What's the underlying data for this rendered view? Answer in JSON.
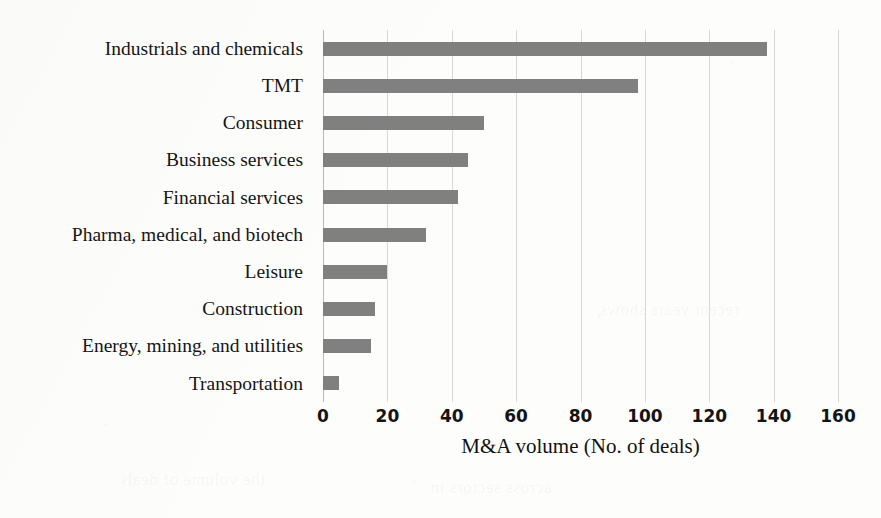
{
  "chart_data": {
    "type": "bar",
    "orientation": "horizontal",
    "title": "",
    "subtitle": "",
    "xlabel": "M&A volume (No. of deals)",
    "ylabel": "",
    "xlim": [
      0,
      160
    ],
    "xticks": [
      "0",
      "20",
      "40",
      "60",
      "80",
      "100",
      "120",
      "140",
      "160"
    ],
    "xtick_values": [
      0,
      20,
      40,
      60,
      80,
      100,
      120,
      140,
      160
    ],
    "grid": "vertical",
    "legend": "none",
    "bar_color": "#808080",
    "gridline_color": "#d8d8d6",
    "background_color": "#fdfdfc",
    "categories": [
      "Industrials and chemicals",
      "TMT",
      "Consumer",
      "Business services",
      "Financial services",
      "Pharma, medical, and biotech",
      "Leisure",
      "Construction",
      "Energy, mining, and utilities",
      "Transportation"
    ],
    "values": [
      138,
      98,
      50,
      45,
      42,
      32,
      20,
      16,
      15,
      5
    ],
    "series": [
      {
        "name": "M&A volume (No. of deals)",
        "values": [
          138,
          98,
          50,
          45,
          42,
          32,
          20,
          16,
          15,
          5
        ]
      }
    ]
  },
  "page": {
    "bleed_through_text": [
      "the volume of deals",
      "across sectors in",
      "recent years shows"
    ]
  }
}
